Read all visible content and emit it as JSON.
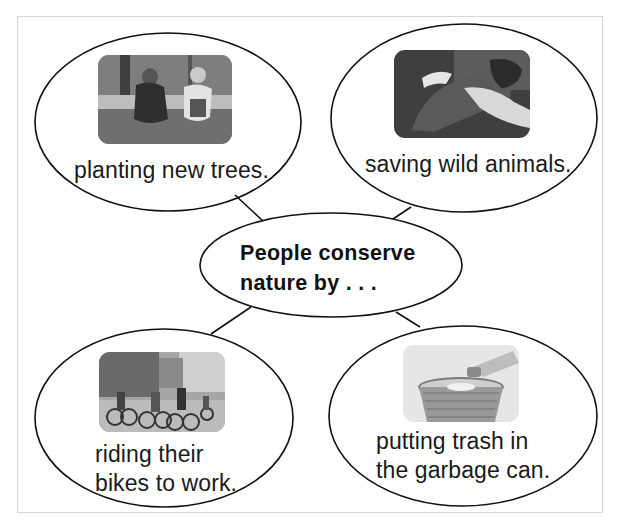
{
  "diagram": {
    "type": "concept-web",
    "center": {
      "line1": "People conserve",
      "line2": "nature by . . ."
    },
    "nodes": [
      {
        "position": "top-left",
        "image": "children-planting-trees-photo",
        "lines": [
          "planting new trees."
        ]
      },
      {
        "position": "top-right",
        "image": "hands-holding-sea-turtle-photo",
        "lines": [
          "saving wild animals."
        ]
      },
      {
        "position": "bottom-left",
        "image": "people-riding-bikes-in-city-photo",
        "lines": [
          "riding their",
          "bikes to work."
        ]
      },
      {
        "position": "bottom-right",
        "image": "hand-dropping-trash-in-wastebasket-photo",
        "lines": [
          "putting trash in",
          "the garbage can."
        ]
      }
    ],
    "colors": {
      "stroke": "#111111",
      "frame_border": "#d6d6d6",
      "background": "#ffffff"
    }
  }
}
